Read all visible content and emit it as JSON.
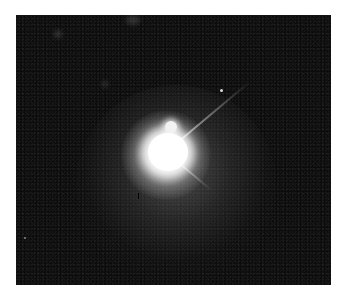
{
  "image": {
    "subject": "astronomical image of a bright point source with diffraction spikes and diffuse halo",
    "background_color": "#0c0c0c",
    "core_color": "#ffffff",
    "page_color": "#ffffff"
  }
}
